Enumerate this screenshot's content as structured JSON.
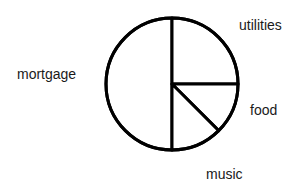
{
  "chart_data": {
    "type": "pie",
    "title": "",
    "categories": [
      "mortgage",
      "utilities",
      "food",
      "music"
    ],
    "values": [
      50,
      25,
      12.5,
      12.5
    ],
    "units": "percent",
    "slices": [
      {
        "label": "mortgage",
        "value": 50,
        "start_angle_deg": 180,
        "end_angle_deg": 360,
        "sweep_deg": 180
      },
      {
        "label": "utilities",
        "value": 25,
        "start_angle_deg": 0,
        "end_angle_deg": 90,
        "sweep_deg": 90
      },
      {
        "label": "food",
        "value": 12.5,
        "start_angle_deg": 90,
        "end_angle_deg": 135,
        "sweep_deg": 45
      },
      {
        "label": "music",
        "value": 12.5,
        "start_angle_deg": 135,
        "end_angle_deg": 180,
        "sweep_deg": 45
      }
    ],
    "fill_color": "#ffffff",
    "stroke_color": "#000000",
    "stroke_width": 3,
    "background_color": "#ffffff",
    "legend": "none",
    "labels_position": "outside",
    "grid": false
  },
  "labels": {
    "mortgage": "mortgage",
    "utilities": "utilities",
    "food": "food",
    "music": "music"
  },
  "geometry": {
    "center_x": 172,
    "center_y": 84,
    "radius": 66
  }
}
